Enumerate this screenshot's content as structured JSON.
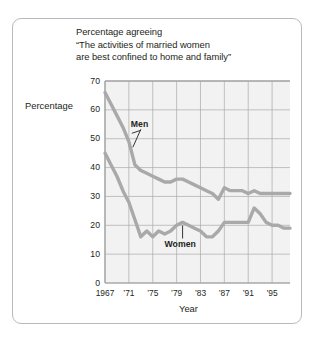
{
  "figure": {
    "title_lines": [
      "Percentage agreeing",
      "“The activities of married women",
      "are best confined to home and family”"
    ],
    "y_axis_title": "Percentage",
    "x_axis_title": "Year",
    "colors": {
      "line": "#a9a9ab",
      "grid": "#a9a9ab",
      "plot_background": "#f2f2f2",
      "frame_border": "#b9babc",
      "text": "#231f20"
    }
  },
  "chart_data": {
    "type": "line",
    "title": "Percentage agreeing “The activities of married women are best confined to home and family”",
    "xlabel": "Year",
    "ylabel": "Percentage",
    "xlim": [
      1967,
      1998
    ],
    "ylim": [
      0,
      70
    ],
    "yticks": [
      0,
      10,
      20,
      30,
      40,
      50,
      60,
      70
    ],
    "ytick_labels": [
      "0",
      "10",
      "20",
      "30",
      "40",
      "50",
      "60",
      "70"
    ],
    "xticks": [
      1967,
      1971,
      1975,
      1979,
      1983,
      1987,
      1991,
      1995
    ],
    "xtick_labels": [
      "1967",
      "’71",
      "’75",
      "’79",
      "’83",
      "’87",
      "’91",
      "’95"
    ],
    "grid": true,
    "legend": "inline-annotations",
    "annotations": [
      {
        "text": "Men",
        "x": 1972,
        "y": 55
      },
      {
        "text": "Women",
        "x": 1980,
        "y": 13
      }
    ],
    "x": [
      1967,
      1968,
      1969,
      1970,
      1971,
      1972,
      1973,
      1974,
      1975,
      1976,
      1977,
      1978,
      1979,
      1980,
      1981,
      1982,
      1983,
      1984,
      1985,
      1986,
      1987,
      1988,
      1989,
      1990,
      1991,
      1992,
      1993,
      1994,
      1995,
      1996,
      1997,
      1998
    ],
    "series": [
      {
        "name": "Men",
        "values": [
          66,
          62,
          58,
          54,
          49,
          41,
          39,
          38,
          37,
          36,
          35,
          35,
          36,
          36,
          35,
          34,
          33,
          32,
          31,
          29,
          33,
          32,
          32,
          32,
          31,
          32,
          31,
          31,
          31,
          31,
          31,
          31
        ]
      },
      {
        "name": "Women",
        "values": [
          45,
          41,
          37,
          32,
          28,
          22,
          16,
          18,
          16,
          18,
          17,
          18,
          20,
          21,
          20,
          19,
          18,
          16,
          16,
          18,
          21,
          21,
          21,
          21,
          21,
          26,
          24,
          21,
          20,
          20,
          19,
          19
        ]
      }
    ]
  }
}
